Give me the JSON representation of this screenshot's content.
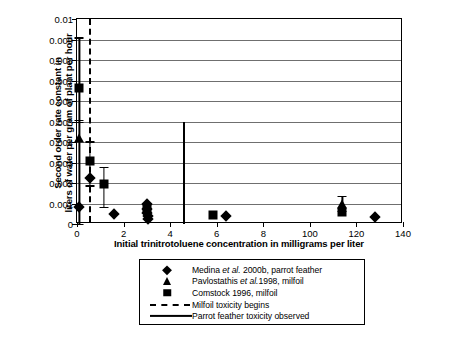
{
  "chart_data": {
    "type": "scatter",
    "title": "",
    "xlabel": "Initial trinitrotoluene concentration in milligrams per liter",
    "ylabel_line1": "Second order rate constant in",
    "ylabel_line2": "liters of water per gram of plant per hour",
    "xlim": [
      0,
      140
    ],
    "ylim": [
      0,
      0.01
    ],
    "xticks": [
      0,
      2,
      4,
      6,
      8,
      100,
      120,
      140
    ],
    "xticklabels": [
      "0",
      "2",
      "4",
      "6",
      "8",
      "100",
      "120",
      "140"
    ],
    "yticks": [
      0,
      0.001,
      0.002,
      0.003,
      0.004,
      0.005,
      0.006,
      0.007,
      0.008,
      0.009,
      0.01
    ],
    "yticklabels": [
      "0",
      "0.001",
      "0.002",
      "0.003",
      "0.004",
      "0.005",
      "0.006",
      "0.007",
      "0.008",
      "0.009",
      "0.01"
    ],
    "grid": "horizontal",
    "legend_position": "below-plot",
    "series": [
      {
        "name": "Medina et al. 2000b, parrot feather",
        "marker": "diamond",
        "points": [
          {
            "x": 0.1,
            "y": 0.00082
          },
          {
            "x": 0.55,
            "y": 0.00222
          },
          {
            "x": 1.6,
            "y": 0.00048
          },
          {
            "x": 3.0,
            "y": 0.00098
          },
          {
            "x": 3.0,
            "y": 0.00072
          },
          {
            "x": 3.0,
            "y": 0.00055
          },
          {
            "x": 3.05,
            "y": 0.00038
          },
          {
            "x": 3.05,
            "y": 0.00024
          },
          {
            "x": 6.4,
            "y": 0.0004
          },
          {
            "x": 128.0,
            "y": 0.00035
          }
        ]
      },
      {
        "name": "Pavlostathis et al.1998, milfoil",
        "marker": "triangle",
        "points": [
          {
            "x": 0.1,
            "y": 0.00418,
            "yerr_low": 0.00418,
            "yerr_high": 0.0009
          },
          {
            "x": 114.0,
            "y": 0.00098,
            "yerr_low": 0.00035,
            "yerr_high": 0.0004
          }
        ]
      },
      {
        "name": "Comstock 1996, milfoil",
        "marker": "square",
        "points": [
          {
            "x": 0.1,
            "y": 0.00665,
            "yerr_low": 0.00165,
            "yerr_high": 0.00245
          },
          {
            "x": 0.55,
            "y": 0.00308,
            "yerr_low": 0.0012,
            "yerr_high": 0.00095
          },
          {
            "x": 1.15,
            "y": 0.00195,
            "yerr_low": 0.0011,
            "yerr_high": 0.00085
          },
          {
            "x": 3.0,
            "y": 0.0008
          },
          {
            "x": 5.85,
            "y": 0.00042
          },
          {
            "x": 114.0,
            "y": 0.0006
          }
        ]
      }
    ],
    "reference_lines": [
      {
        "name": "Milfoil toxicity begins",
        "x": 0.52,
        "style": "dashed",
        "y_from": 0,
        "y_to": 0.01
      },
      {
        "name": "Parrot feather toxicity observed",
        "x": 4.6,
        "style": "solid",
        "y_from": 0,
        "y_to": 0.005
      }
    ],
    "legend_entries": [
      {
        "label_pre": "Medina ",
        "label_it": "et al.",
        "label_post": " 2000b, parrot feather",
        "key": "diamond"
      },
      {
        "label_pre": "Pavlostathis ",
        "label_it": "et al.",
        "label_post": "1998, milfoil",
        "key": "triangle"
      },
      {
        "label_pre": "Comstock 1996, milfoil",
        "label_it": "",
        "label_post": "",
        "key": "square"
      },
      {
        "label_pre": "Milfoil toxicity begins",
        "label_it": "",
        "label_post": "",
        "key": "dashed-line"
      },
      {
        "label_pre": "Parrot feather toxicity observed",
        "label_it": "",
        "label_post": "",
        "key": "solid-line"
      }
    ]
  }
}
